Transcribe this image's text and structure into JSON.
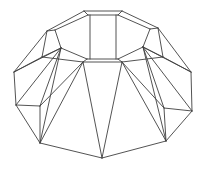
{
  "canvas": {
    "width": 207,
    "height": 169,
    "background": "#ffffff"
  },
  "drawing": {
    "stroke_color": "#3f3f3f",
    "stroke_width": 0.9,
    "vertices": {
      "A1": [
        84,
        11
      ],
      "A2": [
        122,
        11
      ],
      "A3": [
        158,
        28
      ],
      "A4": [
        163,
        57
      ],
      "A5": [
        122,
        62
      ],
      "A6": [
        83,
        62
      ],
      "A7": [
        42,
        57
      ],
      "A8": [
        47,
        31
      ],
      "I1": [
        88,
        15
      ],
      "I2": [
        118,
        15
      ],
      "I3": [
        150,
        29
      ],
      "I8": [
        55,
        30
      ],
      "I5": [
        118,
        59
      ],
      "I6": [
        87,
        59
      ],
      "C1": [
        61,
        48
      ],
      "C2": [
        143,
        47
      ],
      "T1a": [
        90,
        15
      ],
      "T1b": [
        90,
        59
      ],
      "T2a": [
        116,
        15
      ],
      "T2b": [
        116,
        59
      ],
      "L1": [
        14,
        72
      ],
      "L2": [
        16,
        105
      ],
      "M1": [
        40,
        106
      ],
      "B1": [
        40,
        143
      ],
      "APX": [
        102,
        158
      ],
      "B2": [
        166,
        141
      ],
      "M2": [
        164,
        108
      ],
      "R2": [
        192,
        111
      ],
      "R1": [
        191,
        72
      ]
    },
    "edges": [
      [
        "A1",
        "A2"
      ],
      [
        "A2",
        "A3"
      ],
      [
        "A3",
        "A4"
      ],
      [
        "A4",
        "A5"
      ],
      [
        "A5",
        "A6"
      ],
      [
        "A6",
        "A7"
      ],
      [
        "A7",
        "A8"
      ],
      [
        "A8",
        "A1"
      ],
      [
        "I1",
        "I2"
      ],
      [
        "I2",
        "I3"
      ],
      [
        "I3",
        "C2"
      ],
      [
        "C2",
        "I5"
      ],
      [
        "I5",
        "I6"
      ],
      [
        "I6",
        "C1"
      ],
      [
        "C1",
        "I8"
      ],
      [
        "I8",
        "I1"
      ],
      [
        "A1",
        "I1"
      ],
      [
        "A2",
        "I2"
      ],
      [
        "A3",
        "I3"
      ],
      [
        "A8",
        "I8"
      ],
      [
        "A5",
        "I5"
      ],
      [
        "A6",
        "I6"
      ],
      [
        "A7",
        "C1"
      ],
      [
        "A4",
        "C2"
      ],
      [
        "T1a",
        "T1b"
      ],
      [
        "T2a",
        "T2b"
      ],
      [
        "A8",
        "L1"
      ],
      [
        "A7",
        "L1"
      ],
      [
        "C1",
        "L1"
      ],
      [
        "C1",
        "L2"
      ],
      [
        "C1",
        "M1"
      ],
      [
        "C1",
        "B1"
      ],
      [
        "A6",
        "M1"
      ],
      [
        "A6",
        "B1"
      ],
      [
        "L2",
        "M1"
      ],
      [
        "M1",
        "B1"
      ],
      [
        "A6",
        "APX"
      ],
      [
        "L1",
        "L2"
      ],
      [
        "L2",
        "B1"
      ],
      [
        "B1",
        "APX"
      ],
      [
        "A3",
        "R1"
      ],
      [
        "A4",
        "R1"
      ],
      [
        "C2",
        "R1"
      ],
      [
        "C2",
        "R2"
      ],
      [
        "C2",
        "M2"
      ],
      [
        "C2",
        "B2"
      ],
      [
        "A5",
        "M2"
      ],
      [
        "A5",
        "B2"
      ],
      [
        "R2",
        "M2"
      ],
      [
        "M2",
        "B2"
      ],
      [
        "A5",
        "APX"
      ],
      [
        "R1",
        "R2"
      ],
      [
        "R2",
        "B2"
      ],
      [
        "B2",
        "APX"
      ]
    ]
  }
}
